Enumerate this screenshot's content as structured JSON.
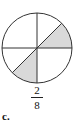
{
  "figure": {
    "label": "c.",
    "fraction": {
      "numerator": "2",
      "denominator": "8"
    },
    "circle": {
      "total_parts": 8,
      "shaded_parts": 2,
      "shade_color": "#d9d9d9",
      "line_color": "#333333"
    }
  }
}
